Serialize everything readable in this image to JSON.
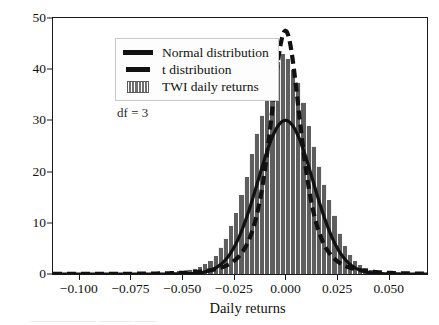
{
  "chart_data": {
    "type": "bar",
    "title": "",
    "xlabel": "Daily returns",
    "ylabel": "",
    "xlim": [
      -0.1125,
      0.0685
    ],
    "ylim": [
      0,
      50
    ],
    "grid": false,
    "xticks": [
      "−0.100",
      "−0.075",
      "−0.050",
      "−0.025",
      "0.000",
      "0.025",
      "0.050"
    ],
    "xtick_values": [
      -0.1,
      -0.075,
      -0.05,
      -0.025,
      0,
      0.025,
      0.05
    ],
    "yticks": [
      "0",
      "10",
      "20",
      "30",
      "40",
      "50"
    ],
    "ytick_values": [
      0,
      10,
      20,
      30,
      40,
      50
    ],
    "annotations": [
      {
        "text": "df = 3",
        "x": -0.0815,
        "y": 31.5
      }
    ],
    "legend": {
      "position": "upper left",
      "entries": [
        {
          "label": "Normal distribution",
          "key": "solid-line",
          "color": "#111111"
        },
        {
          "label": "t distribution",
          "key": "dashed-line",
          "color": "#111111"
        },
        {
          "label": "TWI daily returns",
          "key": "hatched-patch",
          "color": "#6f6f6f"
        }
      ]
    },
    "histogram": {
      "name": "TWI daily returns",
      "facecolor": "#5e5e5e",
      "edgecolor": "#ffffff",
      "bin_width": 0.0025,
      "bin_centers": [
        -0.10875,
        -0.10625,
        -0.10375,
        -0.10125,
        -0.09875,
        -0.09625,
        -0.09375,
        -0.09125,
        -0.08875,
        -0.08625,
        -0.08375,
        -0.08125,
        -0.07875,
        -0.07625,
        -0.07375,
        -0.07125,
        -0.06875,
        -0.06625,
        -0.06375,
        -0.06125,
        -0.05875,
        -0.05625,
        -0.05375,
        -0.05125,
        -0.04875,
        -0.04625,
        -0.04375,
        -0.04125,
        -0.03875,
        -0.03625,
        -0.03375,
        -0.03125,
        -0.02875,
        -0.02625,
        -0.02375,
        -0.02125,
        -0.01875,
        -0.01625,
        -0.01375,
        -0.01125,
        -0.00875,
        -0.00625,
        -0.00375,
        -0.00125,
        0.00125,
        0.00375,
        0.00625,
        0.00875,
        0.01125,
        0.01375,
        0.01625,
        0.01875,
        0.02125,
        0.02375,
        0.02625,
        0.02875,
        0.03125,
        0.03375,
        0.03625,
        0.03875,
        0.04125,
        0.04375,
        0.04625,
        0.04875,
        0.05125,
        0.05375,
        0.05625,
        0.05875,
        0.06125,
        0.06375
      ],
      "counts": [
        0.15,
        0,
        0,
        0,
        0,
        0.1,
        0,
        0,
        0,
        0.15,
        0,
        0,
        0,
        0.2,
        0,
        0.1,
        0,
        0.25,
        0,
        0.3,
        0.2,
        0.4,
        0.3,
        0.6,
        0.5,
        0.9,
        1.1,
        1.4,
        2.0,
        2.6,
        3.6,
        5.2,
        7.0,
        9.5,
        12.0,
        15.5,
        19.0,
        23.5,
        27.5,
        31.0,
        36.0,
        39.5,
        41.5,
        43.0,
        42.0,
        40.0,
        37.5,
        33.5,
        29.0,
        25.0,
        21.0,
        17.5,
        14.5,
        11.5,
        8.0,
        5.5,
        3.8,
        2.6,
        1.8,
        1.2,
        0.8,
        0.6,
        0.45,
        0.3,
        0.25,
        0.2,
        0.15,
        0.1,
        0.1,
        0.1
      ]
    },
    "series": [
      {
        "name": "Normal distribution",
        "style": "solid",
        "linewidth": 3.2,
        "color": "#111111",
        "mean": 0.0,
        "std": 0.0133,
        "peak": 30.0
      },
      {
        "name": "t distribution",
        "style": "dashed",
        "linewidth": 4.2,
        "color": "#111111",
        "df": 3,
        "mean": 0.0,
        "scale": 0.0079,
        "peak": 47.5
      }
    ]
  },
  "figure": {
    "caption_faint": "——————  ———  ——"
  }
}
